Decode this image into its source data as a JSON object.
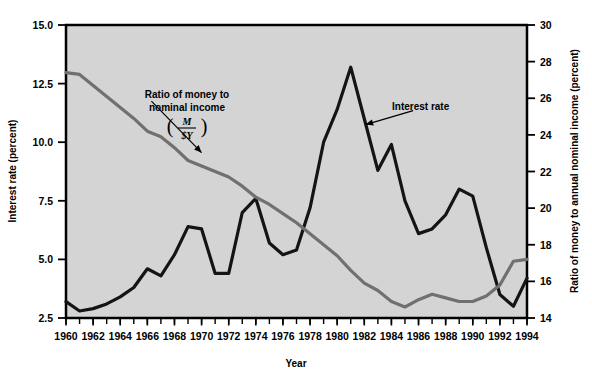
{
  "chart_data": {
    "type": "line",
    "title": "",
    "xlabel": "Year",
    "ylabel": "Interest rate (percent)",
    "y2label": "Ratio of money to annual nominal income (percent)",
    "x": [
      1960,
      1961,
      1962,
      1963,
      1964,
      1965,
      1966,
      1967,
      1968,
      1969,
      1970,
      1971,
      1972,
      1973,
      1974,
      1975,
      1976,
      1977,
      1978,
      1979,
      1980,
      1981,
      1982,
      1983,
      1984,
      1985,
      1986,
      1987,
      1988,
      1989,
      1990,
      1991,
      1992,
      1993,
      1994
    ],
    "xlim": [
      1960,
      1994
    ],
    "ylim": [
      2.5,
      15.0
    ],
    "y2lim": [
      14,
      30
    ],
    "yticks": [
      2.5,
      5.0,
      7.5,
      10.0,
      12.5,
      15.0
    ],
    "ytick_labels": [
      "2.5",
      "5.0",
      "7.5",
      "10.0",
      "12.5",
      "15.0"
    ],
    "y2ticks": [
      14,
      16,
      18,
      20,
      22,
      24,
      26,
      28,
      30
    ],
    "y2tick_labels": [
      "14",
      "16",
      "18",
      "20",
      "22",
      "24",
      "26",
      "28",
      "30"
    ],
    "xticks_major": [
      1960,
      1962,
      1964,
      1966,
      1968,
      1970,
      1972,
      1974,
      1976,
      1978,
      1980,
      1982,
      1984,
      1986,
      1988,
      1990,
      1992,
      1994
    ],
    "xtick_labels": [
      "1960",
      "1962",
      "1964",
      "1966",
      "1968",
      "1970",
      "1972",
      "1974",
      "1976",
      "1978",
      "1980",
      "1982",
      "1984",
      "1986",
      "1988",
      "1990",
      "1992",
      "1994"
    ],
    "minor_ticks_every": 1,
    "grid": false,
    "legend_position": "inline-annotations",
    "series": [
      {
        "name": "Interest rate",
        "axis": "left",
        "color": "#141414",
        "values": [
          3.2,
          2.8,
          2.9,
          3.1,
          3.4,
          3.8,
          4.6,
          4.3,
          5.2,
          6.4,
          6.3,
          4.4,
          4.4,
          7.0,
          7.6,
          5.7,
          5.2,
          5.4,
          7.2,
          10.0,
          11.4,
          13.2,
          11.0,
          8.8,
          9.9,
          7.5,
          6.1,
          6.3,
          6.9,
          8.0,
          7.7,
          5.5,
          3.5,
          3.0,
          4.2
        ]
      },
      {
        "name": "Ratio of money to nominal income",
        "axis": "right",
        "color": "#707070",
        "values": [
          27.4,
          27.3,
          26.7,
          26.1,
          25.5,
          24.9,
          24.2,
          23.9,
          23.3,
          22.6,
          22.3,
          22.0,
          21.7,
          21.2,
          20.6,
          20.2,
          19.7,
          19.2,
          18.6,
          18.0,
          17.4,
          16.6,
          15.9,
          15.5,
          14.9,
          14.6,
          15.0,
          15.3,
          15.1,
          14.9,
          14.9,
          15.2,
          15.8,
          17.1,
          17.2
        ]
      }
    ],
    "annotations": [
      {
        "name": "money-ratio-annotation",
        "lines": [
          "Ratio of money to",
          "nominal income"
        ],
        "formula_numerator": "M",
        "formula_denominator": "$Y",
        "arrow_from": [
          1966.3,
          11.75
        ],
        "arrow_to": [
          1970.0,
          9.55
        ]
      },
      {
        "name": "interest-rate-annotation",
        "label": "Interest rate",
        "arrow_from": [
          1985.6,
          11.35
        ],
        "arrow_to": [
          1982.1,
          10.75
        ]
      }
    ]
  },
  "style": {
    "plot_bg": "#d4d4d4",
    "page_bg": "#ffffff",
    "axis_color": "#000000"
  }
}
